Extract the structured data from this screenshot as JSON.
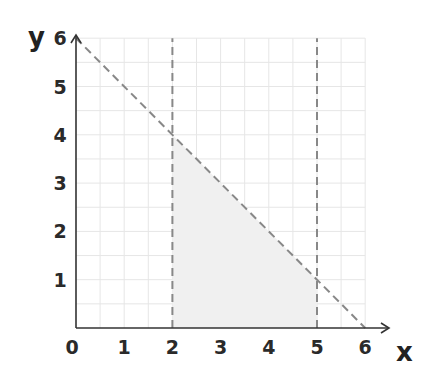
{
  "chart_data": {
    "type": "line",
    "title": "",
    "xlabel": "x",
    "ylabel": "y",
    "xlim": [
      0,
      6
    ],
    "ylim": [
      0,
      6
    ],
    "grid": true,
    "grid_step": 0.5,
    "x_ticks": [
      "0",
      "1",
      "2",
      "3",
      "4",
      "5",
      "6"
    ],
    "y_ticks": [
      "1",
      "2",
      "3",
      "4",
      "5",
      "6"
    ],
    "series": [
      {
        "name": "x + y = 6",
        "style": "dashed",
        "points": [
          [
            0,
            6
          ],
          [
            6,
            0
          ]
        ]
      },
      {
        "name": "x = 2",
        "style": "dashed",
        "points": [
          [
            2,
            0
          ],
          [
            2,
            6
          ]
        ]
      },
      {
        "name": "x = 5",
        "style": "dashed",
        "points": [
          [
            5,
            0
          ],
          [
            5,
            6
          ]
        ]
      }
    ],
    "shaded_region": {
      "description": "feasible region bounded by x=2, x=5, y=0 and x+y=6",
      "vertices": [
        [
          2,
          0
        ],
        [
          5,
          0
        ],
        [
          5,
          1
        ],
        [
          2,
          4
        ]
      ],
      "color": "#f0f0f0"
    },
    "colors": {
      "axis": "#333333",
      "dashed_line": "#888888",
      "grid": "#e6e6e6",
      "shade": "#f0f0f0"
    }
  }
}
